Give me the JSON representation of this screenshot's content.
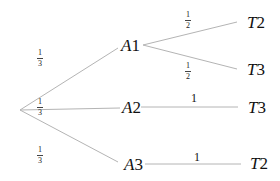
{
  "diagram": {
    "type": "probability-tree",
    "root": {
      "label": ""
    },
    "level1": [
      {
        "id": "A1",
        "letter": "A",
        "num": "1",
        "prob_num": "1",
        "prob_den": "3"
      },
      {
        "id": "A2",
        "letter": "A",
        "num": "2",
        "prob_num": "1",
        "prob_den": "3"
      },
      {
        "id": "A3",
        "letter": "A",
        "num": "3",
        "prob_num": "1",
        "prob_den": "3"
      }
    ],
    "level2": [
      {
        "parent": "A1",
        "letter": "T",
        "num": "2",
        "prob_num": "1",
        "prob_den": "2"
      },
      {
        "parent": "A1",
        "letter": "T",
        "num": "3",
        "prob_num": "1",
        "prob_den": "2"
      },
      {
        "parent": "A2",
        "letter": "T",
        "num": "3",
        "prob": "1"
      },
      {
        "parent": "A3",
        "letter": "T",
        "num": "2",
        "prob": "1"
      }
    ],
    "colors": {
      "line": "#b0b0b0",
      "text": "#111111"
    }
  }
}
